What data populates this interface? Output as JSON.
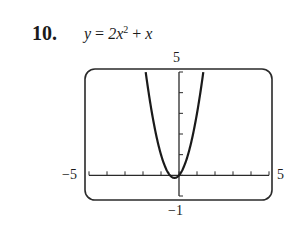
{
  "problem": {
    "number": "10.",
    "equation_lhs": "y",
    "equation_eq": "=",
    "equation_coef": "2x",
    "equation_exp": "2",
    "equation_plus": "+",
    "equation_tail": "x"
  },
  "window_labels": {
    "ymax": "5",
    "ymin": "−1",
    "xmin": "−5",
    "xmax": "5"
  },
  "chart_data": {
    "type": "line",
    "function": "y = 2x^2 + x",
    "xlabel": "",
    "ylabel": "",
    "xlim": [
      -5,
      5
    ],
    "ylim": [
      -1,
      5
    ],
    "xticks": [
      -5,
      -4,
      -3,
      -2,
      -1,
      0,
      1,
      2,
      3,
      4,
      5
    ],
    "yticks": [
      -1,
      0,
      1,
      2,
      3,
      4,
      5
    ],
    "grid": false,
    "series": [
      {
        "name": "y = 2x^2 + x",
        "x": [
          -1.85,
          -1.5,
          -1.25,
          -1.0,
          -0.75,
          -0.5,
          -0.25,
          0,
          0.25,
          0.5,
          0.75,
          1.0,
          1.35
        ],
        "y": [
          5.0,
          3.0,
          1.875,
          1.0,
          0.375,
          0.0,
          -0.125,
          0.0,
          0.375,
          1.0,
          1.875,
          3.0,
          5.0
        ]
      }
    ],
    "vertex": [
      -0.25,
      -0.125
    ],
    "curve_color": "#1a1a1a"
  }
}
